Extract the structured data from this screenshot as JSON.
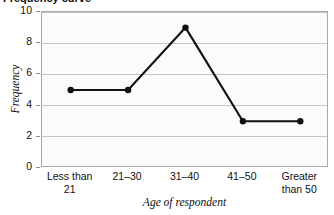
{
  "chart_data": {
    "type": "line",
    "title": "Frequency curve",
    "title_visible_fragment": "ncy curve",
    "xlabel": "Age of respondent",
    "ylabel": "Frequency",
    "categories": [
      "Less than 21",
      "21–30",
      "31–40",
      "41–50",
      "Greater than 50"
    ],
    "category_lines": [
      [
        "Less than",
        "21"
      ],
      [
        "21–30",
        ""
      ],
      [
        "31–40",
        ""
      ],
      [
        "41–50",
        ""
      ],
      [
        "Greater",
        "than 50"
      ]
    ],
    "values": [
      5,
      5,
      9,
      3,
      3
    ],
    "ylim": [
      0,
      10
    ],
    "ytick_labels": [
      "0",
      "2",
      "4",
      "6",
      "8",
      "10"
    ],
    "ytick_values": [
      0,
      2,
      4,
      6,
      8,
      10
    ],
    "grid": true,
    "grid_axis": "y",
    "legend": null,
    "legend_position": "none",
    "marker": "circle",
    "series": [
      {
        "name": "Frequency",
        "values": [
          5,
          5,
          9,
          3,
          3
        ]
      }
    ]
  },
  "style": {
    "line_color": "#111111",
    "marker_color": "#111111",
    "grid_color": "#c4c4c4",
    "frame_color": "#a9a9a9",
    "plot_background": "#fbfbfb",
    "page_background": "#ffffff",
    "text_color": "#111111"
  }
}
